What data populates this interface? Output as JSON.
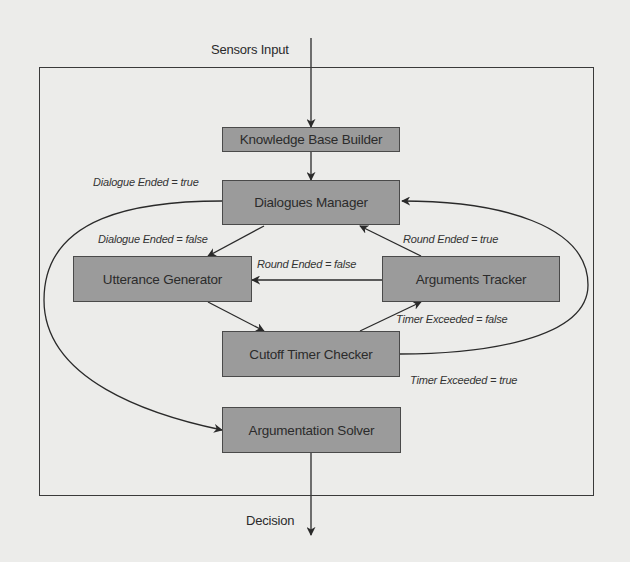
{
  "diagram": {
    "input_label": "Sensors Input",
    "output_label": "Decision",
    "nodes": {
      "knowledge_base_builder": "Knowledge Base Builder",
      "dialogues_manager": "Dialogues Manager",
      "utterance_generator": "Utterance Generator",
      "arguments_tracker": "Arguments Tracker",
      "cutoff_timer_checker": "Cutoff Timer Checker",
      "argumentation_solver": "Argumentation Solver"
    },
    "edge_labels": {
      "dialogue_ended_true": "Dialogue Ended = true",
      "dialogue_ended_false": "Dialogue Ended = false",
      "round_ended_true": "Round Ended = true",
      "round_ended_false": "Round Ended = false",
      "timer_exceeded_false": "Timer Exceeded = false",
      "timer_exceeded_true": "Timer Exceeded = true"
    },
    "edges": [
      {
        "from": "Sensors Input",
        "to": "Knowledge Base Builder"
      },
      {
        "from": "Knowledge Base Builder",
        "to": "Dialogues Manager"
      },
      {
        "from": "Dialogues Manager",
        "to": "Utterance Generator",
        "label": "Dialogue Ended = false"
      },
      {
        "from": "Dialogues Manager",
        "to": "Argumentation Solver",
        "label": "Dialogue Ended = true"
      },
      {
        "from": "Utterance Generator",
        "to": "Cutoff Timer Checker"
      },
      {
        "from": "Cutoff Timer Checker",
        "to": "Arguments Tracker",
        "label": "Timer Exceeded = false"
      },
      {
        "from": "Cutoff Timer Checker",
        "to": "Dialogues Manager",
        "label": "Timer Exceeded = true"
      },
      {
        "from": "Arguments Tracker",
        "to": "Utterance Generator",
        "label": "Round Ended = false"
      },
      {
        "from": "Arguments Tracker",
        "to": "Dialogues Manager",
        "label": "Round Ended = true"
      },
      {
        "from": "Argumentation Solver",
        "to": "Decision"
      }
    ],
    "colors": {
      "background": "#ececea",
      "node_fill": "#9b9b9b",
      "node_border": "#4a4a4a",
      "line": "#2a2a2a"
    }
  }
}
